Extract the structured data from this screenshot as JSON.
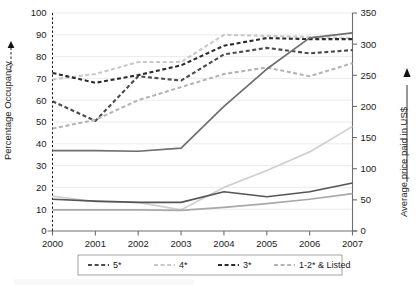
{
  "chart_data": {
    "type": "line",
    "title": "",
    "xlabel": "",
    "ylabel": "Percentage Occupancy",
    "y2label": "Average price paid in US$",
    "categories": [
      "2000",
      "2001",
      "2002",
      "2003",
      "2004",
      "2005",
      "2006",
      "2007"
    ],
    "x": [
      2000,
      2001,
      2002,
      2003,
      2004,
      2005,
      2006,
      2007
    ],
    "ylim": [
      0,
      100
    ],
    "yticks": [
      0,
      10,
      20,
      30,
      40,
      50,
      60,
      70,
      80,
      90,
      100
    ],
    "y2lim": [
      0,
      350
    ],
    "y2ticks": [
      0,
      50,
      100,
      150,
      200,
      250,
      300,
      350
    ],
    "grid": true,
    "legend_position": "bottom",
    "series": [
      {
        "name": "5*",
        "legend_label": "5*",
        "axis": "left",
        "style": "dashed",
        "color": "#4a4a4a",
        "measure": "Percentage Occupancy",
        "values": [
          59.5,
          50.5,
          71.0,
          69.0,
          81.0,
          84.0,
          81.5,
          83.0
        ]
      },
      {
        "name": "4*",
        "legend_label": "4*",
        "axis": "left",
        "style": "dashed",
        "color": "#c8c8c8",
        "measure": "Percentage Occupancy",
        "values": [
          69.5,
          72.0,
          77.5,
          77.5,
          90.0,
          89.5,
          89.0,
          88.5
        ]
      },
      {
        "name": "3*",
        "legend_label": "3*",
        "axis": "left",
        "style": "dashed",
        "color": "#2b2b2b",
        "measure": "Percentage Occupancy",
        "values": [
          72.5,
          68.0,
          71.5,
          76.0,
          85.0,
          88.5,
          88.0,
          88.0
        ]
      },
      {
        "name": "1-2* & Listed",
        "legend_label": "1-2* & Listed",
        "axis": "left",
        "style": "dashed",
        "color": "#b4b4b4",
        "measure": "Percentage Occupancy",
        "values": [
          47.0,
          51.0,
          60.0,
          66.0,
          72.0,
          75.0,
          71.0,
          77.0
        ]
      },
      {
        "name": "5* price",
        "legend_label": "5*",
        "axis": "right",
        "style": "solid",
        "color": "#6e6e6e",
        "measure": "Average price paid in US$",
        "values": [
          129,
          129,
          128,
          133,
          200,
          260,
          310,
          318
        ]
      },
      {
        "name": "4* price",
        "legend_label": "4*",
        "axis": "right",
        "style": "solid",
        "color": "#cfcfcf",
        "measure": "Average price paid in US$",
        "values": [
          56,
          47,
          46,
          34,
          70,
          97,
          127,
          168
        ]
      },
      {
        "name": "3* price",
        "legend_label": "3*",
        "axis": "right",
        "style": "solid",
        "color": "#555555",
        "measure": "Average price paid in US$",
        "values": [
          51,
          48,
          46,
          46,
          63,
          55,
          63,
          77
        ]
      },
      {
        "name": "1-2* & Listed price",
        "legend_label": "1-2* & Listed",
        "axis": "right",
        "style": "solid",
        "color": "#a8a8a8",
        "measure": "Average price paid in US$",
        "values": [
          34,
          34,
          34,
          33,
          38,
          44,
          51,
          60
        ]
      }
    ],
    "legend": [
      {
        "label": "5*",
        "color": "#4a4a4a",
        "style": "dashed"
      },
      {
        "label": "4*",
        "color": "#c8c8c8",
        "style": "dashed"
      },
      {
        "label": "3*",
        "color": "#2b2b2b",
        "style": "dashed"
      },
      {
        "label": "1-2* & Listed",
        "color": "#b4b4b4",
        "style": "dashed"
      }
    ]
  },
  "axes": {
    "left_title": "Percentage Occupancy",
    "right_title": "Average price paid in US$",
    "left_ticks": [
      "0",
      "10",
      "20",
      "30",
      "40",
      "50",
      "60",
      "70",
      "80",
      "90",
      "100"
    ],
    "right_ticks": [
      "0",
      "50",
      "100",
      "150",
      "200",
      "250",
      "300",
      "350"
    ],
    "x_ticks": [
      "2000",
      "2001",
      "2002",
      "2003",
      "2004",
      "2005",
      "2006",
      "2007"
    ]
  },
  "colors": {
    "grid": "#e2e2e2",
    "axis": "#6f6f6f",
    "text": "#1a1a1a",
    "legend_border": "#9a9a9a"
  }
}
